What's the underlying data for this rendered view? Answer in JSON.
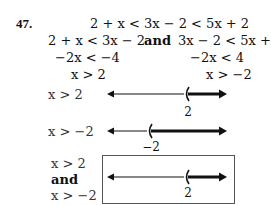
{
  "problem": {
    "number": "47.",
    "original": "2 + x < 3x − 2 < 5x + 2",
    "split_left": "2 + x < 3x − 2",
    "and_word": "and",
    "split_right": "3x − 2 < 5x + 2",
    "step_left": "−2x < −4",
    "step_right": "−2x < 4",
    "result_left": "x > 2",
    "result_right": "x > −2"
  },
  "number_lines": [
    {
      "label": "x > 2",
      "point_label": "2",
      "point_x": 186,
      "y": 94
    },
    {
      "label": "x > −2",
      "point_label": "−2",
      "point_x": 149,
      "y": 131
    },
    {
      "label_top": "x > 2",
      "label_mid": "and",
      "label_bottom": "x > −2",
      "point_label": "2",
      "point_x": 186,
      "y": 177
    }
  ]
}
